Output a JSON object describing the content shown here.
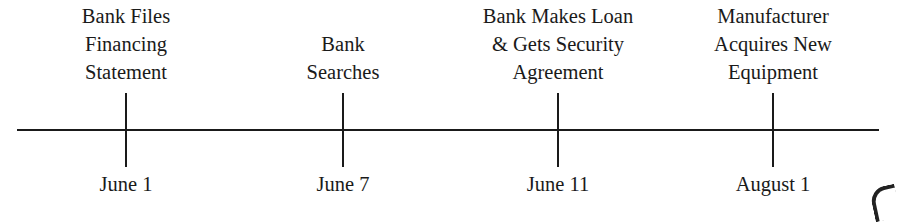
{
  "timeline": {
    "events": [
      {
        "x": 126,
        "label_lines": [
          "Bank Files",
          "Financing",
          "Statement"
        ],
        "date": "June 1"
      },
      {
        "x": 343,
        "label_lines": [
          "Bank",
          "Searches"
        ],
        "date": "June 7"
      },
      {
        "x": 558,
        "label_lines": [
          "Bank Makes Loan",
          "& Gets Security",
          "Agreement"
        ],
        "date": "June 11"
      },
      {
        "x": 773,
        "label_lines": [
          "Manufacturer",
          "Acquires New",
          "Equipment"
        ],
        "date": "August 1"
      }
    ],
    "axis_color": "#1a1a1a",
    "text_color": "#1a1a1a"
  }
}
